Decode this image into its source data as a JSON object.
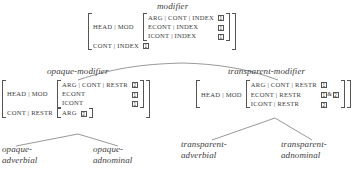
{
  "figure": {
    "kind": "avm-type-hierarchy",
    "colors": {
      "ink": "#3c3c3c",
      "rule": "#555555",
      "background": "#ffffff"
    }
  },
  "nodes": {
    "root": {
      "label": "modifier",
      "avm": {
        "rows": [
          {
            "attr": "HEAD | MOD",
            "nested": {
              "rows": [
                {
                  "attr": "ARG | CONT | INDEX",
                  "tags": [
                    "1"
                  ]
                },
                {
                  "attr": "ECONT | INDEX",
                  "tags": [
                    "1"
                  ]
                },
                {
                  "attr": "ICONT | INDEX",
                  "tags": [
                    "1"
                  ]
                }
              ]
            }
          },
          {
            "attr": "CONT | INDEX",
            "tags": [
              "1"
            ]
          }
        ]
      }
    },
    "opaque": {
      "label": "opaque-modifier",
      "avm": {
        "rows": [
          {
            "attr": "HEAD | MOD",
            "nested": {
              "rows": [
                {
                  "attr": "ARG | CONT | RESTR",
                  "tags": [
                    "2"
                  ]
                },
                {
                  "attr": "ECONT",
                  "tags": [
                    "1"
                  ]
                },
                {
                  "attr": "ICONT",
                  "tags": [
                    "1"
                  ]
                }
              ]
            }
          },
          {
            "attr": "CONT | RESTR",
            "nested": {
              "rows": [
                {
                  "attr": "ARG",
                  "tags": [
                    "2"
                  ]
                }
              ]
            }
          }
        ]
      }
    },
    "transparent": {
      "label": "transparent-modifier",
      "avm": {
        "rows": [
          {
            "attr": "HEAD | MOD",
            "nested": {
              "rows": [
                {
                  "attr": "ARG | CONT | RESTR",
                  "tags": [
                    "1"
                  ]
                },
                {
                  "attr": "ECONT | RESTR",
                  "tags": [
                    "1",
                    "2"
                  ],
                  "join": "&"
                },
                {
                  "attr": "ICONT | RESTR",
                  "tags": [
                    "2"
                  ]
                }
              ]
            }
          }
        ]
      }
    }
  },
  "leaves": {
    "opaque_adverbial": {
      "line1": "opaque-",
      "line2": "adverbial"
    },
    "opaque_adnominal": {
      "line1": "opaque-",
      "line2": "adnominal"
    },
    "transparent_adverbial": {
      "line1": "transparent-",
      "line2": "adverbial"
    },
    "transparent_adnominal": {
      "line1": "transparent-",
      "line2": "adnominal"
    }
  }
}
